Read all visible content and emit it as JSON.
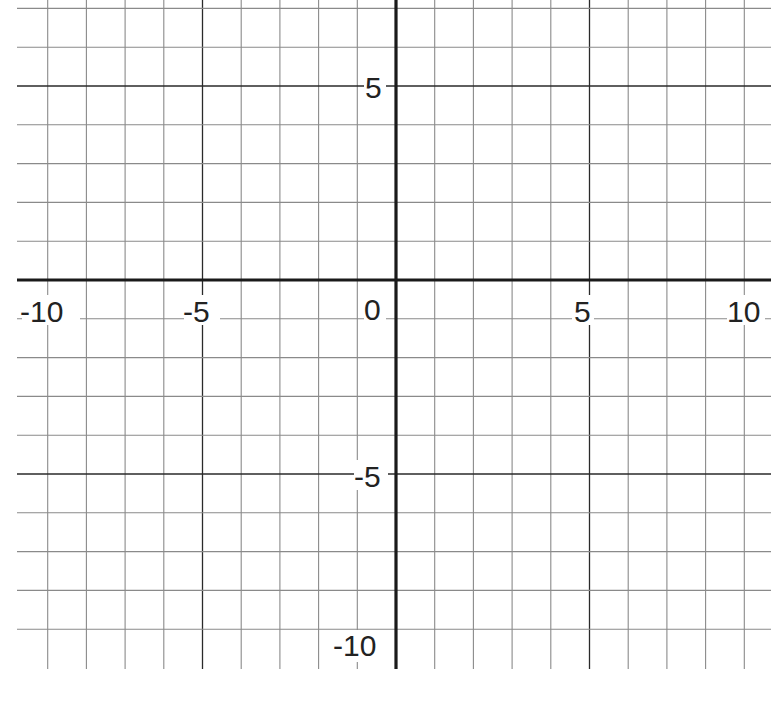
{
  "chart_data": {
    "type": "grid",
    "title": "",
    "xlabel": "",
    "ylabel": "",
    "xlim": [
      -10,
      10
    ],
    "ylim": [
      -10,
      7
    ],
    "grid": true,
    "grid_step": 1,
    "major_step": 5,
    "x_tick_labels": [
      "-10",
      "-5",
      "0",
      "5",
      "10"
    ],
    "y_tick_labels": [
      "5",
      "-5",
      "-10"
    ],
    "series": []
  },
  "labels": {
    "x_neg10": "-10",
    "x_neg5": "-5",
    "origin": "0",
    "x_5": "5",
    "x_10": "10",
    "y_5": "5",
    "y_neg5": "-5",
    "y_neg10": "-10"
  },
  "colors": {
    "background": "#ffffff",
    "minor_grid": "#8a8a8a",
    "major_grid": "#2a2a2a",
    "axis": "#1a1a1a",
    "text": "#222222"
  }
}
